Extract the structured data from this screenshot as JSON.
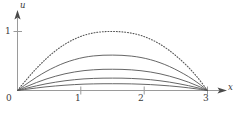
{
  "chart_data": {
    "type": "line",
    "title": "",
    "xlabel": "x",
    "ylabel": "u",
    "xlim": [
      0,
      3.35
    ],
    "ylim": [
      0,
      1.35
    ],
    "grid": false,
    "legend": "none",
    "x_ticks": [
      {
        "value": 0,
        "label": "0"
      },
      {
        "value": 1,
        "label": "1"
      },
      {
        "value": 2,
        "label": "2"
      },
      {
        "value": 3,
        "label": "3"
      }
    ],
    "y_ticks": [
      {
        "value": 1,
        "label": "1"
      }
    ],
    "annotations": [],
    "series": [
      {
        "name": "t0",
        "style": "dotted",
        "color": "#555555",
        "peak_x": 1.62,
        "peak_y": 1.0,
        "x": [
          0,
          0.15,
          0.3,
          0.45,
          0.6,
          0.75,
          0.9,
          1.05,
          1.2,
          1.35,
          1.5,
          1.65,
          1.8,
          1.95,
          2.1,
          2.25,
          2.4,
          2.55,
          2.7,
          2.85,
          3
        ],
        "y": [
          0,
          0.195,
          0.375,
          0.535,
          0.672,
          0.785,
          0.872,
          0.936,
          0.976,
          0.996,
          1.0,
          0.994,
          0.972,
          0.932,
          0.87,
          0.785,
          0.676,
          0.544,
          0.392,
          0.212,
          0
        ]
      },
      {
        "name": "t1",
        "style": "solid",
        "color": "#555555",
        "peak_x": 1.62,
        "peak_y": 0.6,
        "x": [
          0,
          0.15,
          0.3,
          0.45,
          0.6,
          0.75,
          0.9,
          1.05,
          1.2,
          1.35,
          1.5,
          1.65,
          1.8,
          1.95,
          2.1,
          2.25,
          2.4,
          2.55,
          2.7,
          2.85,
          3
        ],
        "y": [
          0,
          0.117,
          0.225,
          0.321,
          0.403,
          0.471,
          0.523,
          0.562,
          0.586,
          0.598,
          0.6,
          0.596,
          0.583,
          0.559,
          0.522,
          0.471,
          0.406,
          0.326,
          0.235,
          0.127,
          0
        ]
      },
      {
        "name": "t2",
        "style": "solid",
        "color": "#555555",
        "peak_x": 1.62,
        "peak_y": 0.36,
        "x": [
          0,
          0.15,
          0.3,
          0.45,
          0.6,
          0.75,
          0.9,
          1.05,
          1.2,
          1.35,
          1.5,
          1.65,
          1.8,
          1.95,
          2.1,
          2.25,
          2.4,
          2.55,
          2.7,
          2.85,
          3
        ],
        "y": [
          0,
          0.07,
          0.135,
          0.193,
          0.242,
          0.283,
          0.314,
          0.337,
          0.351,
          0.359,
          0.36,
          0.358,
          0.35,
          0.335,
          0.313,
          0.283,
          0.243,
          0.196,
          0.141,
          0.076,
          0
        ]
      },
      {
        "name": "t3",
        "style": "solid",
        "color": "#555555",
        "peak_x": 1.62,
        "peak_y": 0.21,
        "x": [
          0,
          0.15,
          0.3,
          0.45,
          0.6,
          0.75,
          0.9,
          1.05,
          1.2,
          1.35,
          1.5,
          1.65,
          1.8,
          1.95,
          2.1,
          2.25,
          2.4,
          2.55,
          2.7,
          2.85,
          3
        ],
        "y": [
          0,
          0.041,
          0.079,
          0.113,
          0.141,
          0.165,
          0.183,
          0.197,
          0.205,
          0.209,
          0.21,
          0.209,
          0.204,
          0.196,
          0.183,
          0.165,
          0.142,
          0.114,
          0.082,
          0.044,
          0
        ]
      },
      {
        "name": "t4",
        "style": "solid",
        "color": "#555555",
        "peak_x": 1.62,
        "peak_y": 0.115,
        "x": [
          0,
          0.15,
          0.3,
          0.45,
          0.6,
          0.75,
          0.9,
          1.05,
          1.2,
          1.35,
          1.5,
          1.65,
          1.8,
          1.95,
          2.1,
          2.25,
          2.4,
          2.55,
          2.7,
          2.85,
          3
        ],
        "y": [
          0,
          0.022,
          0.043,
          0.062,
          0.077,
          0.09,
          0.1,
          0.108,
          0.112,
          0.1145,
          0.115,
          0.1143,
          0.112,
          0.107,
          0.1,
          0.09,
          0.078,
          0.063,
          0.045,
          0.024,
          0
        ]
      }
    ]
  },
  "labels": {
    "y_axis": "u",
    "x_axis": "x",
    "y_tick_1": "1",
    "x_tick_0": "0",
    "x_tick_1": "1",
    "x_tick_2": "2",
    "x_tick_3": "3"
  },
  "colors": {
    "axis": "#8a8a8a",
    "curve": "#555555",
    "text": "#3a3a3a",
    "background": "#ffffff"
  }
}
